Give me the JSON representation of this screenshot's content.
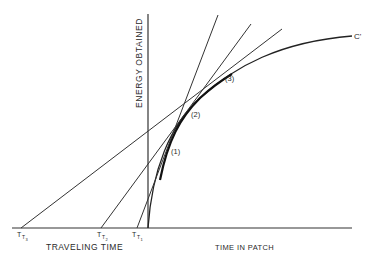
{
  "figure": {
    "y_axis_label": "ENERGY OBTAINED",
    "x_axis_left_label": "TRAVELING TIME",
    "x_axis_right_label": "TIME IN PATCH",
    "curve_label": "C'",
    "points": [
      {
        "label": "(1)"
      },
      {
        "label": "(2)"
      },
      {
        "label": "(3)"
      }
    ],
    "travel_times": [
      {
        "label": "T",
        "sub1": "T",
        "sub2": "3"
      },
      {
        "label": "T",
        "sub1": "T",
        "sub2": "2"
      },
      {
        "label": "T",
        "sub1": "T",
        "sub2": "1"
      }
    ],
    "line_color": "#333333"
  }
}
